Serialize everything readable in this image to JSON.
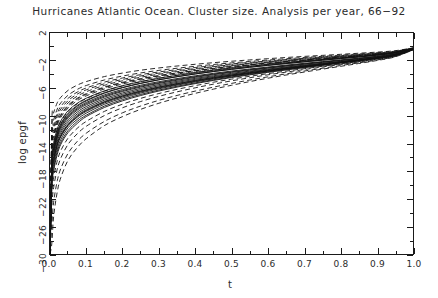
{
  "chart_data": {
    "type": "line",
    "title": "Hurricanes Atlantic Ocean. Cluster size. Analysis per year, 66−92",
    "xlabel": "t",
    "ylabel": "log epgf",
    "xlim": [
      0.0,
      1.0
    ],
    "ylim": [
      -30,
      2
    ],
    "grid": false,
    "legend": null,
    "x_ticks": [
      "0.0",
      "0.1",
      "0.2",
      "0.3",
      "0.4",
      "0.5",
      "0.6",
      "0.7",
      "0.8",
      "0.9",
      "1.0"
    ],
    "x_tick_values": [
      0.0,
      0.1,
      0.2,
      0.3,
      0.4,
      0.5,
      0.6,
      0.7,
      0.8,
      0.9,
      1.0
    ],
    "x_minor_step": 0.05,
    "y_ticks": [
      "2",
      "−2",
      "−6",
      "−10",
      "−14",
      "−18",
      "−22",
      "−26",
      "−30"
    ],
    "y_tick_values": [
      2,
      -2,
      -6,
      -10,
      -14,
      -18,
      -22,
      -26,
      -30
    ],
    "y_minor_step": 2,
    "tick_direction": "in",
    "line_color": "#111111",
    "background": "#ffffff",
    "x": [
      0.0,
      0.005,
      0.01,
      0.02,
      0.03,
      0.05,
      0.075,
      0.1,
      0.15,
      0.2,
      0.25,
      0.3,
      0.35,
      0.4,
      0.45,
      0.5,
      0.55,
      0.6,
      0.65,
      0.7,
      0.75,
      0.8,
      0.85,
      0.9,
      0.95,
      1.0
    ],
    "series": [
      {
        "name": "1966",
        "dash": "solid",
        "values": [
          -30.0,
          -17.8,
          -15.5,
          -13.3,
          -12.1,
          -10.6,
          -9.45,
          -8.65,
          -7.5,
          -6.68,
          -6.02,
          -5.47,
          -5.0,
          -4.57,
          -4.19,
          -3.84,
          -3.52,
          -3.22,
          -2.93,
          -2.65,
          -2.38,
          -2.11,
          -1.84,
          -1.54,
          -1.15,
          -0.35
        ]
      },
      {
        "name": "1967",
        "dash": "dashed",
        "values": [
          -30.0,
          -16.3,
          -14.1,
          -12.0,
          -10.8,
          -9.35,
          -8.25,
          -7.5,
          -6.42,
          -5.66,
          -5.05,
          -4.55,
          -4.12,
          -3.74,
          -3.4,
          -3.09,
          -2.81,
          -2.55,
          -2.3,
          -2.07,
          -1.84,
          -1.62,
          -1.4,
          -1.16,
          -0.86,
          -0.25
        ]
      },
      {
        "name": "1968",
        "dash": "solid",
        "values": [
          -30.0,
          -19.0,
          -16.6,
          -14.3,
          -13.0,
          -11.4,
          -10.2,
          -9.35,
          -8.12,
          -7.25,
          -6.55,
          -5.96,
          -5.45,
          -4.99,
          -4.57,
          -4.19,
          -3.84,
          -3.51,
          -3.19,
          -2.88,
          -2.58,
          -2.28,
          -1.98,
          -1.65,
          -1.23,
          -0.38
        ]
      },
      {
        "name": "1969",
        "dash": "dashed",
        "values": [
          -30.0,
          -14.8,
          -12.8,
          -10.9,
          -9.78,
          -8.45,
          -7.45,
          -6.78,
          -5.82,
          -5.14,
          -4.6,
          -4.15,
          -3.77,
          -3.43,
          -3.12,
          -2.84,
          -2.59,
          -2.35,
          -2.12,
          -1.9,
          -1.69,
          -1.49,
          -1.28,
          -1.06,
          -0.78,
          -0.22
        ]
      },
      {
        "name": "1970",
        "dash": "solid",
        "values": [
          -30.0,
          -18.2,
          -15.9,
          -13.7,
          -12.4,
          -10.9,
          -9.72,
          -8.9,
          -7.72,
          -6.88,
          -6.21,
          -5.64,
          -5.15,
          -4.71,
          -4.32,
          -3.96,
          -3.62,
          -3.31,
          -3.01,
          -2.72,
          -2.44,
          -2.16,
          -1.88,
          -1.57,
          -1.17,
          -0.36
        ]
      },
      {
        "name": "1971",
        "dash": "dashed",
        "values": [
          -30.0,
          -21.5,
          -19.0,
          -16.5,
          -15.0,
          -13.2,
          -11.8,
          -10.8,
          -9.35,
          -8.3,
          -7.46,
          -6.76,
          -6.16,
          -5.62,
          -5.13,
          -4.68,
          -4.27,
          -3.89,
          -3.52,
          -3.17,
          -2.82,
          -2.48,
          -2.14,
          -1.78,
          -1.32,
          -0.4
        ]
      },
      {
        "name": "1972",
        "dash": "solid",
        "values": [
          -30.0,
          -16.9,
          -14.6,
          -12.5,
          -11.2,
          -9.75,
          -8.62,
          -7.84,
          -6.72,
          -5.93,
          -5.3,
          -4.78,
          -4.33,
          -3.93,
          -3.57,
          -3.25,
          -2.95,
          -2.68,
          -2.42,
          -2.17,
          -1.93,
          -1.7,
          -1.47,
          -1.22,
          -0.9,
          -0.26
        ]
      },
      {
        "name": "1973",
        "dash": "dashed",
        "values": [
          -30.0,
          -13.6,
          -11.8,
          -10.0,
          -9.0,
          -7.78,
          -6.85,
          -6.23,
          -5.35,
          -4.72,
          -4.22,
          -3.81,
          -3.46,
          -3.15,
          -2.86,
          -2.61,
          -2.37,
          -2.15,
          -1.94,
          -1.74,
          -1.55,
          -1.36,
          -1.17,
          -0.97,
          -0.71,
          -0.2
        ]
      },
      {
        "name": "1974",
        "dash": "solid",
        "values": [
          -30.0,
          -20.1,
          -17.6,
          -15.2,
          -13.8,
          -12.1,
          -10.8,
          -9.9,
          -8.58,
          -7.64,
          -6.89,
          -6.26,
          -5.71,
          -5.22,
          -4.77,
          -4.36,
          -3.98,
          -3.63,
          -3.29,
          -2.97,
          -2.65,
          -2.33,
          -2.02,
          -1.68,
          -1.25,
          -0.38
        ]
      },
      {
        "name": "1975",
        "dash": "dashed",
        "values": [
          -30.0,
          -15.4,
          -13.3,
          -11.4,
          -10.2,
          -8.85,
          -7.8,
          -7.1,
          -6.1,
          -5.38,
          -4.82,
          -4.35,
          -3.94,
          -3.58,
          -3.26,
          -2.96,
          -2.69,
          -2.44,
          -2.2,
          -1.98,
          -1.76,
          -1.55,
          -1.34,
          -1.11,
          -0.82,
          -0.23
        ]
      },
      {
        "name": "1976",
        "dash": "solid",
        "values": [
          -30.0,
          -17.3,
          -15.0,
          -12.9,
          -11.6,
          -10.1,
          -9.0,
          -8.23,
          -7.13,
          -6.34,
          -5.71,
          -5.19,
          -4.73,
          -4.32,
          -3.95,
          -3.62,
          -3.31,
          -3.02,
          -2.74,
          -2.47,
          -2.21,
          -1.96,
          -1.7,
          -1.42,
          -1.06,
          -0.32
        ]
      },
      {
        "name": "1977",
        "dash": "dashed",
        "values": [
          -30.0,
          -12.2,
          -10.6,
          -9.0,
          -8.1,
          -7.0,
          -6.17,
          -5.6,
          -4.8,
          -4.23,
          -3.78,
          -3.41,
          -3.1,
          -2.82,
          -2.56,
          -2.33,
          -2.12,
          -1.92,
          -1.73,
          -1.55,
          -1.38,
          -1.21,
          -1.04,
          -0.86,
          -0.63,
          -0.18
        ]
      },
      {
        "name": "1978",
        "dash": "solid",
        "values": [
          -30.0,
          -18.7,
          -16.3,
          -14.0,
          -12.7,
          -11.2,
          -9.95,
          -9.12,
          -7.92,
          -7.06,
          -6.38,
          -5.8,
          -5.3,
          -4.85,
          -4.44,
          -4.07,
          -3.72,
          -3.4,
          -3.09,
          -2.79,
          -2.5,
          -2.21,
          -1.92,
          -1.6,
          -1.19,
          -0.36
        ]
      },
      {
        "name": "1979",
        "dash": "dashed",
        "values": [
          -30.0,
          -23.2,
          -20.4,
          -17.7,
          -16.1,
          -14.1,
          -12.6,
          -11.5,
          -9.95,
          -8.82,
          -7.92,
          -7.17,
          -6.52,
          -5.94,
          -5.41,
          -4.93,
          -4.48,
          -4.06,
          -3.67,
          -3.29,
          -2.92,
          -2.56,
          -2.2,
          -1.82,
          -1.35,
          -0.42
        ]
      },
      {
        "name": "1980",
        "dash": "solid",
        "values": [
          -30.0,
          -16.1,
          -13.9,
          -11.9,
          -10.7,
          -9.25,
          -8.18,
          -7.44,
          -6.38,
          -5.63,
          -5.04,
          -4.55,
          -4.13,
          -3.75,
          -3.41,
          -3.1,
          -2.82,
          -2.56,
          -2.31,
          -2.07,
          -1.84,
          -1.62,
          -1.4,
          -1.16,
          -0.86,
          -0.25
        ]
      },
      {
        "name": "1981",
        "dash": "dashed",
        "values": [
          -30.0,
          -14.2,
          -12.3,
          -10.5,
          -9.4,
          -8.12,
          -7.15,
          -6.5,
          -5.58,
          -4.92,
          -4.4,
          -3.97,
          -3.6,
          -3.28,
          -2.98,
          -2.71,
          -2.47,
          -2.24,
          -2.02,
          -1.81,
          -1.61,
          -1.42,
          -1.22,
          -1.01,
          -0.75,
          -0.21
        ]
      },
      {
        "name": "1982",
        "dash": "solid",
        "values": [
          -30.0,
          -19.6,
          -17.1,
          -14.8,
          -13.4,
          -11.7,
          -10.5,
          -9.6,
          -8.32,
          -7.42,
          -6.69,
          -6.08,
          -5.55,
          -5.07,
          -4.64,
          -4.24,
          -3.87,
          -3.53,
          -3.2,
          -2.89,
          -2.58,
          -2.27,
          -1.97,
          -1.64,
          -1.22,
          -0.37
        ]
      },
      {
        "name": "1983",
        "dash": "dashed",
        "values": [
          -30.0,
          -11.0,
          -9.55,
          -8.1,
          -7.3,
          -6.3,
          -5.55,
          -5.03,
          -4.31,
          -3.8,
          -3.39,
          -3.06,
          -2.78,
          -2.53,
          -2.3,
          -2.09,
          -1.9,
          -1.72,
          -1.55,
          -1.39,
          -1.24,
          -1.09,
          -0.93,
          -0.77,
          -0.57,
          -0.16
        ]
      },
      {
        "name": "1984",
        "dash": "solid",
        "values": [
          -30.0,
          -17.6,
          -15.3,
          -13.1,
          -11.8,
          -10.3,
          -9.18,
          -8.4,
          -7.28,
          -6.47,
          -5.83,
          -5.3,
          -4.84,
          -4.42,
          -4.04,
          -3.7,
          -3.39,
          -3.09,
          -2.8,
          -2.53,
          -2.26,
          -2.0,
          -1.74,
          -1.45,
          -1.08,
          -0.33
        ]
      },
      {
        "name": "1985",
        "dash": "dashed",
        "values": [
          -30.0,
          -15.0,
          -13.0,
          -11.1,
          -9.95,
          -8.6,
          -7.58,
          -6.9,
          -5.92,
          -5.23,
          -4.68,
          -4.22,
          -3.83,
          -3.48,
          -3.17,
          -2.88,
          -2.62,
          -2.37,
          -2.14,
          -1.92,
          -1.71,
          -1.51,
          -1.3,
          -1.08,
          -0.8,
          -0.23
        ]
      },
      {
        "name": "1986",
        "dash": "solid",
        "values": [
          -30.0,
          -18.9,
          -16.5,
          -14.2,
          -12.9,
          -11.3,
          -10.1,
          -9.22,
          -8.0,
          -7.14,
          -6.45,
          -5.86,
          -5.36,
          -4.9,
          -4.49,
          -4.11,
          -3.76,
          -3.43,
          -3.12,
          -2.82,
          -2.52,
          -2.23,
          -1.94,
          -1.62,
          -1.2,
          -0.37
        ]
      },
      {
        "name": "1987",
        "dash": "dashed",
        "values": [
          -30.0,
          -13.0,
          -11.3,
          -9.6,
          -8.62,
          -7.45,
          -6.56,
          -5.96,
          -5.11,
          -4.51,
          -4.03,
          -3.64,
          -3.3,
          -3.0,
          -2.73,
          -2.48,
          -2.26,
          -2.05,
          -1.85,
          -1.66,
          -1.47,
          -1.3,
          -1.12,
          -0.92,
          -0.68,
          -0.19
        ]
      },
      {
        "name": "1988",
        "dash": "solid",
        "values": [
          -30.0,
          -20.6,
          -18.0,
          -15.6,
          -14.1,
          -12.4,
          -11.1,
          -10.1,
          -8.78,
          -7.82,
          -7.05,
          -6.4,
          -5.83,
          -5.33,
          -4.87,
          -4.45,
          -4.06,
          -3.7,
          -3.35,
          -3.02,
          -2.7,
          -2.38,
          -2.06,
          -1.71,
          -1.27,
          -0.39
        ]
      },
      {
        "name": "1989",
        "dash": "dashed",
        "values": [
          -30.0,
          -25.8,
          -22.5,
          -19.4,
          -17.6,
          -15.4,
          -13.7,
          -12.5,
          -10.8,
          -9.55,
          -8.57,
          -7.75,
          -7.04,
          -6.41,
          -5.84,
          -5.3,
          -4.81,
          -4.35,
          -3.92,
          -3.51,
          -3.11,
          -2.72,
          -2.33,
          -1.92,
          -1.42,
          -0.44
        ]
      },
      {
        "name": "1990",
        "dash": "solid",
        "values": [
          -30.0,
          -16.6,
          -14.4,
          -12.3,
          -11.1,
          -9.6,
          -8.5,
          -7.74,
          -6.64,
          -5.88,
          -5.27,
          -4.76,
          -4.32,
          -3.93,
          -3.58,
          -3.26,
          -2.96,
          -2.69,
          -2.43,
          -2.18,
          -1.94,
          -1.71,
          -1.48,
          -1.23,
          -0.91,
          -0.27
        ]
      },
      {
        "name": "1991",
        "dash": "dashed",
        "values": [
          -30.0,
          -28.5,
          -24.6,
          -21.0,
          -18.9,
          -16.4,
          -14.6,
          -13.3,
          -11.4,
          -10.1,
          -9.05,
          -8.17,
          -7.41,
          -6.74,
          -6.13,
          -5.57,
          -5.04,
          -4.55,
          -4.09,
          -3.66,
          -3.24,
          -2.83,
          -2.42,
          -1.99,
          -1.47,
          -0.45
        ]
      },
      {
        "name": "1992",
        "dash": "solid",
        "values": [
          -30.0,
          -17.0,
          -14.8,
          -12.7,
          -11.4,
          -9.95,
          -8.83,
          -8.06,
          -6.96,
          -6.18,
          -5.56,
          -5.05,
          -4.6,
          -4.2,
          -3.84,
          -3.51,
          -3.21,
          -2.93,
          -2.65,
          -2.39,
          -2.14,
          -1.89,
          -1.64,
          -1.37,
          -1.02,
          -0.31
        ]
      }
    ]
  }
}
